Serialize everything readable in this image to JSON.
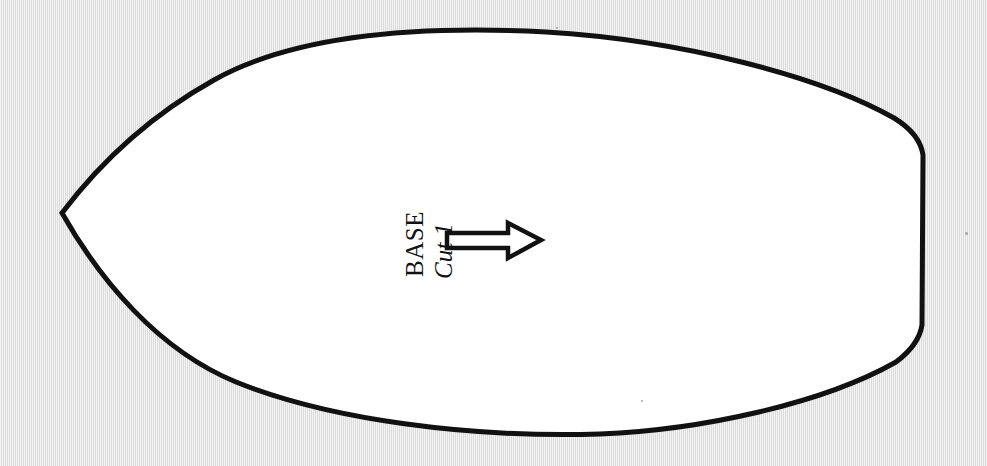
{
  "document": {
    "kind": "sewing-pattern-piece",
    "background_color": "#e4e4e4",
    "piece_fill_color": "#ffffff",
    "outline_color": "#111111"
  },
  "pattern": {
    "piece_name": "BASE",
    "cut_instruction": "Cut 1",
    "grainline_arrow": {
      "icon": "right-arrow-outline",
      "direction": "right",
      "style": "hollow-outlined"
    },
    "outline": {
      "description": "Leaf/teardrop shaped pattern piece with a sharp point at the left and a flat vertical edge at the right",
      "left_point": [
        62,
        213
      ],
      "right_edge_top": [
        923,
        155
      ],
      "right_edge_bottom": [
        922,
        325
      ],
      "top_apex": [
        545,
        32
      ],
      "bottom_apex": [
        620,
        434
      ],
      "stroke_width": 5
    }
  },
  "annotations": {
    "dust_specks": [
      {
        "x": 965,
        "y": 232,
        "size": 3
      },
      {
        "x": 641,
        "y": 400,
        "size": 2
      },
      {
        "x": 556,
        "y": 27,
        "size": 2
      }
    ]
  }
}
